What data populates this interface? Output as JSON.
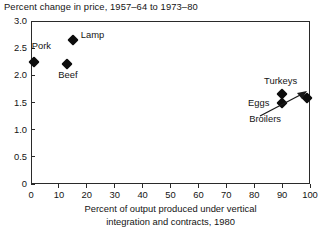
{
  "chart_data": {
    "type": "scatter",
    "title": "Percent change in price, 1957–64 to 1973–80",
    "xlabel_line1": "Percent of output produced under vertical",
    "xlabel_line2": "integration and contracts, 1980",
    "ylabel": "Percent change in price, 1957–64 to 1973–80",
    "xlim": [
      0,
      100
    ],
    "ylim": [
      0,
      3.0
    ],
    "xticks": [
      "0",
      "10",
      "20",
      "30",
      "40",
      "50",
      "60",
      "70",
      "80",
      "90",
      "100"
    ],
    "xtick_values": [
      0,
      10,
      20,
      30,
      40,
      50,
      60,
      70,
      80,
      90,
      100
    ],
    "yticks": [
      "0",
      "0.5",
      "1.0",
      "1.5",
      "2.0",
      "2.5",
      "3.0"
    ],
    "ytick_values": [
      0,
      0.5,
      1.0,
      1.5,
      2.0,
      2.5,
      3.0
    ],
    "grid": false,
    "legend": "none",
    "marker_style": "filled-diamond",
    "marker_color": "#0d0d0d",
    "points": [
      {
        "label": "Pork",
        "x": 1,
        "y": 2.25,
        "label_dx": -2,
        "label_dy": -16
      },
      {
        "label": "Lamp",
        "x": 15,
        "y": 2.65,
        "label_dx": 8,
        "label_dy": -5
      },
      {
        "label": "Beef",
        "x": 13,
        "y": 2.2,
        "label_dx": -9,
        "label_dy": 11
      },
      {
        "label": "Turkeys",
        "x": 90,
        "y": 1.65,
        "label_dx": -18,
        "label_dy": -13
      },
      {
        "label": "Eggs",
        "x": 90,
        "y": 1.5,
        "label_dx": -34,
        "label_dy": 0
      },
      {
        "label": "Broilers",
        "x": 99,
        "y": 1.58,
        "label_dx": -58,
        "label_dy": 21
      }
    ],
    "annotations": [
      {
        "name": "broilers-arrow",
        "points_to": "Broilers",
        "style": "line-arrow"
      }
    ]
  },
  "colors": {
    "background": "#ffffff",
    "axis": "#2a2a2a",
    "text": "#141414",
    "marker": "#0d0d0d"
  }
}
